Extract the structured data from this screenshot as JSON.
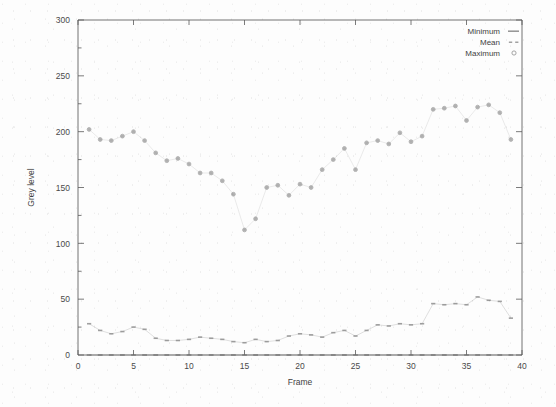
{
  "chart_data": {
    "type": "scatter",
    "title": "",
    "xlabel": "Frame",
    "ylabel": "Grey level",
    "xlim": [
      0,
      40
    ],
    "ylim": [
      0,
      300
    ],
    "xticks": [
      0,
      5,
      10,
      15,
      20,
      25,
      30,
      35,
      40
    ],
    "yticks": [
      0,
      50,
      100,
      150,
      200,
      250,
      300
    ],
    "xtick_labels": [
      "0",
      "5",
      "10",
      "15",
      "20",
      "25",
      "30",
      "35",
      "40"
    ],
    "ytick_labels": [
      "0",
      "50",
      "100",
      "150",
      "200",
      "250",
      "300"
    ],
    "grid": false,
    "legend_position": "top-right",
    "x": [
      1,
      2,
      3,
      4,
      5,
      6,
      7,
      8,
      9,
      10,
      11,
      12,
      13,
      14,
      15,
      16,
      17,
      18,
      19,
      20,
      21,
      22,
      23,
      24,
      25,
      26,
      27,
      28,
      29,
      30,
      31,
      32,
      33,
      34,
      35,
      36,
      37,
      38,
      39
    ],
    "series": [
      {
        "name": "Minimum",
        "marker": "dash",
        "color": "#6d6d6d",
        "values": [
          0,
          0,
          0,
          0,
          0,
          0,
          0,
          0,
          0,
          0,
          0,
          0,
          0,
          0,
          0,
          0,
          0,
          0,
          0,
          0,
          0,
          0,
          0,
          0,
          0,
          0,
          0,
          0,
          0,
          0,
          0,
          0,
          0,
          0,
          0,
          0,
          0,
          0,
          0
        ]
      },
      {
        "name": "Mean",
        "marker": "dot",
        "color": "#8a8a8a",
        "values": [
          28,
          22,
          19,
          21,
          25,
          23,
          15,
          13,
          13,
          14,
          16,
          15,
          14,
          12,
          11,
          14,
          12,
          13,
          17,
          19,
          18,
          16,
          20,
          22,
          17,
          22,
          27,
          26,
          28,
          27,
          28,
          46,
          45,
          46,
          45,
          52,
          49,
          48,
          33
        ]
      },
      {
        "name": "Maximum",
        "marker": "circle",
        "color": "#9a9a9a",
        "values": [
          202,
          193,
          192,
          196,
          200,
          192,
          181,
          174,
          176,
          171,
          163,
          163,
          156,
          144,
          112,
          122,
          150,
          152,
          143,
          153,
          150,
          166,
          175,
          185,
          166,
          190,
          192,
          189,
          199,
          191,
          196,
          220,
          221,
          223,
          210,
          222,
          224,
          217,
          193
        ]
      }
    ]
  },
  "legend": {
    "entries": [
      {
        "label": "Minimum",
        "marker": "dash"
      },
      {
        "label": "Mean",
        "marker": "dot"
      },
      {
        "label": "Maximum",
        "marker": "circle"
      }
    ]
  },
  "axes": {
    "x_title": "Frame",
    "y_title": "Grey level"
  }
}
